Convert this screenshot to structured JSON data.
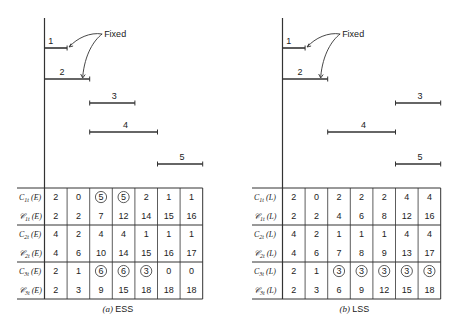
{
  "fixed_label": "Fixed",
  "panels": [
    {
      "id": "ess",
      "caption_prefix": "(a)",
      "caption": "ESS",
      "suffix": "E",
      "activities": [
        {
          "label": "1",
          "start": 0,
          "end": 1
        },
        {
          "label": "2",
          "start": 0,
          "end": 2
        },
        {
          "label": "3",
          "start": 2,
          "end": 4
        },
        {
          "label": "4",
          "start": 2,
          "end": 5
        },
        {
          "label": "5",
          "start": 5,
          "end": 7
        }
      ],
      "fixed_activities": [
        "1",
        "2"
      ],
      "rows": [
        {
          "label_main": "C",
          "label_sub": "1t",
          "label_arg": "(E)",
          "script": false,
          "values": [
            "2",
            "0",
            "5",
            "5",
            "2",
            "1",
            "1"
          ],
          "circled": [
            false,
            false,
            true,
            true,
            false,
            false,
            false
          ]
        },
        {
          "label_main": "𝒞",
          "label_sub": "1t",
          "label_arg": "(E)",
          "script": true,
          "values": [
            "2",
            "2",
            "7",
            "12",
            "14",
            "15",
            "16"
          ],
          "circled": [
            false,
            false,
            false,
            false,
            false,
            false,
            false
          ]
        },
        {
          "label_main": "C",
          "label_sub": "2t",
          "label_arg": "(E)",
          "script": false,
          "values": [
            "4",
            "2",
            "4",
            "4",
            "1",
            "1",
            "1"
          ],
          "circled": [
            false,
            false,
            false,
            false,
            false,
            false,
            false
          ]
        },
        {
          "label_main": "𝒞",
          "label_sub": "2t",
          "label_arg": "(E)",
          "script": true,
          "values": [
            "4",
            "6",
            "10",
            "14",
            "15",
            "16",
            "17"
          ],
          "circled": [
            false,
            false,
            false,
            false,
            false,
            false,
            false
          ]
        },
        {
          "label_main": "C",
          "label_sub": "3t",
          "label_arg": "(E)",
          "script": false,
          "values": [
            "2",
            "1",
            "6",
            "6",
            "3",
            "0",
            "0"
          ],
          "circled": [
            false,
            false,
            true,
            true,
            true,
            false,
            false
          ]
        },
        {
          "label_main": "𝒞",
          "label_sub": "3t",
          "label_arg": "(E)",
          "script": true,
          "values": [
            "2",
            "3",
            "9",
            "15",
            "18",
            "18",
            "18"
          ],
          "circled": [
            false,
            false,
            false,
            false,
            false,
            false,
            false
          ]
        }
      ]
    },
    {
      "id": "lss",
      "caption_prefix": "(b)",
      "caption": "LSS",
      "suffix": "L",
      "activities": [
        {
          "label": "1",
          "start": 0,
          "end": 1
        },
        {
          "label": "2",
          "start": 0,
          "end": 2
        },
        {
          "label": "3",
          "start": 5,
          "end": 7
        },
        {
          "label": "4",
          "start": 2,
          "end": 5
        },
        {
          "label": "5",
          "start": 5,
          "end": 7
        }
      ],
      "fixed_activities": [
        "1",
        "2"
      ],
      "rows": [
        {
          "label_main": "C",
          "label_sub": "1t",
          "label_arg": "(L)",
          "script": false,
          "values": [
            "2",
            "0",
            "2",
            "2",
            "2",
            "4",
            "4"
          ],
          "circled": [
            false,
            false,
            false,
            false,
            false,
            false,
            false
          ]
        },
        {
          "label_main": "𝒞",
          "label_sub": "1t",
          "label_arg": "(L)",
          "script": true,
          "values": [
            "2",
            "2",
            "4",
            "6",
            "8",
            "12",
            "16"
          ],
          "circled": [
            false,
            false,
            false,
            false,
            false,
            false,
            false
          ]
        },
        {
          "label_main": "C",
          "label_sub": "2t",
          "label_arg": "(L)",
          "script": false,
          "values": [
            "4",
            "2",
            "1",
            "1",
            "1",
            "4",
            "4"
          ],
          "circled": [
            false,
            false,
            false,
            false,
            false,
            false,
            false
          ]
        },
        {
          "label_main": "𝒞",
          "label_sub": "2t",
          "label_arg": "(L)",
          "script": true,
          "values": [
            "4",
            "6",
            "7",
            "8",
            "9",
            "13",
            "17"
          ],
          "circled": [
            false,
            false,
            false,
            false,
            false,
            false,
            false
          ]
        },
        {
          "label_main": "C",
          "label_sub": "3t",
          "label_arg": "(L)",
          "script": false,
          "values": [
            "2",
            "1",
            "3",
            "3",
            "3",
            "3",
            "3"
          ],
          "circled": [
            false,
            false,
            true,
            true,
            true,
            true,
            true
          ]
        },
        {
          "label_main": "𝒞",
          "label_sub": "3t",
          "label_arg": "(L)",
          "script": true,
          "values": [
            "2",
            "3",
            "6",
            "9",
            "12",
            "15",
            "18"
          ],
          "circled": [
            false,
            false,
            false,
            false,
            false,
            false,
            false
          ]
        }
      ]
    }
  ]
}
